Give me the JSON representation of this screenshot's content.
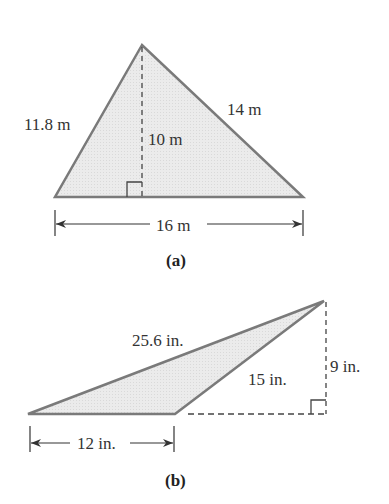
{
  "figure_a": {
    "caption": "(a)",
    "labels": {
      "left_side": "11.8 m",
      "right_side": "14 m",
      "height": "10 m",
      "base": "16 m"
    },
    "vertices": {
      "apex": [
        142,
        45
      ],
      "base_left": [
        55,
        197
      ],
      "base_right": [
        303,
        197
      ]
    },
    "height_foot": [
      142,
      197
    ]
  },
  "figure_b": {
    "caption": "(b)",
    "labels": {
      "long_side": "25.6 in.",
      "short_side": "15 in.",
      "height": "9 in.",
      "base": "12 in."
    },
    "vertices": {
      "left": [
        28,
        414
      ],
      "base_right": [
        175,
        414
      ],
      "top": [
        324,
        300
      ]
    },
    "height_foot": [
      324,
      414
    ]
  },
  "colors": {
    "fill": "#e6e6e6",
    "stroke": "#7a7a7a",
    "text": "#333333",
    "dim_line": "#333333"
  }
}
